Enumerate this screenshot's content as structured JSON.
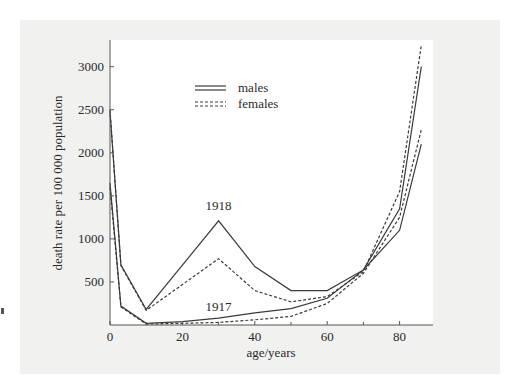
{
  "chart_data": {
    "type": "line",
    "title": "",
    "xlabel": "age/years",
    "ylabel": "death rate per 100 000 population",
    "xlim": [
      0,
      90
    ],
    "ylim": [
      0,
      3300
    ],
    "xticks": [
      0,
      20,
      40,
      60,
      80
    ],
    "xtick_labels": [
      "0",
      "20",
      "40",
      "60",
      "80"
    ],
    "yticks": [
      500,
      1000,
      1500,
      2000,
      2500,
      3000
    ],
    "ytick_labels": [
      "500",
      "1000",
      "1500",
      "2000",
      "2500",
      "3000"
    ],
    "grid": false,
    "legend_position": "upper-left-center",
    "legend": [
      {
        "label": "males",
        "style": "solid"
      },
      {
        "label": "females",
        "style": "dashed"
      }
    ],
    "annotations": [
      {
        "text": "1918",
        "x": 30,
        "y": 1330
      },
      {
        "text": "1917",
        "x": 30,
        "y": 160
      }
    ],
    "series": [
      {
        "name": "1918 males",
        "style": "solid",
        "x": [
          0,
          3,
          10,
          30,
          40,
          50,
          60,
          70,
          80,
          86
        ],
        "values": [
          2480,
          700,
          180,
          1210,
          680,
          400,
          400,
          640,
          1350,
          3000
        ]
      },
      {
        "name": "1918 females",
        "style": "dashed",
        "x": [
          0,
          3,
          10,
          30,
          40,
          50,
          60,
          70,
          80,
          86
        ],
        "values": [
          2500,
          690,
          170,
          770,
          400,
          270,
          330,
          620,
          1550,
          3250
        ]
      },
      {
        "name": "1917 males",
        "style": "solid",
        "x": [
          0,
          3,
          10,
          20,
          30,
          40,
          50,
          60,
          70,
          80,
          86
        ],
        "values": [
          1650,
          220,
          20,
          40,
          80,
          140,
          190,
          310,
          640,
          1100,
          2100
        ]
      },
      {
        "name": "1917 females",
        "style": "dashed",
        "x": [
          0,
          3,
          10,
          20,
          30,
          40,
          50,
          60,
          70,
          80,
          86
        ],
        "values": [
          1600,
          210,
          10,
          20,
          30,
          60,
          100,
          250,
          600,
          1250,
          2270
        ]
      }
    ],
    "colors": {
      "line": "#3a3a3a",
      "axis": "#555555",
      "plot_bg": "#ffffff",
      "panel_bg": "#f1f1f0"
    }
  }
}
